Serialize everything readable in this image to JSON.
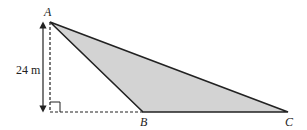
{
  "diagram": {
    "type": "geometry-triangle",
    "points": {
      "A": {
        "label": "A",
        "x": 50,
        "y": 22
      },
      "B": {
        "label": "B",
        "x": 143,
        "y": 112
      },
      "C": {
        "label": "C",
        "x": 288,
        "y": 112
      },
      "foot": {
        "x": 50,
        "y": 112
      }
    },
    "height_label": "24 m",
    "shaded_triangle": [
      "A",
      "B",
      "C"
    ],
    "fill_color": "#d3d3d3",
    "line_color": "#222222",
    "right_angle_marker": true
  }
}
